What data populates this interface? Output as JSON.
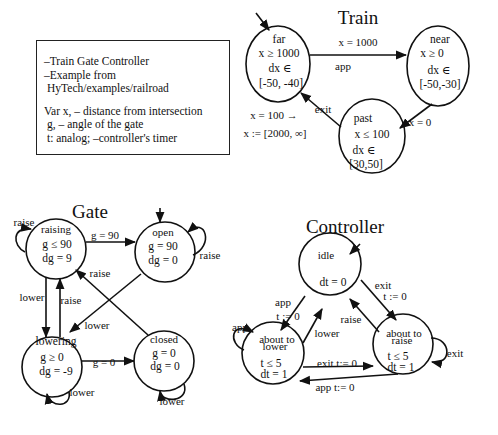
{
  "info_box": {
    "lines_top": [
      "–Train Gate Controller",
      "–Example from",
      " HyTech/examples/railroad"
    ],
    "lines_bottom": [
      "Var x, – distance from intersection",
      " g, – angle of the gate",
      " t: analog; –controller's timer"
    ]
  },
  "train": {
    "title": "Train",
    "states": {
      "far": {
        "name": "far",
        "invariant": "x ≥ 1000",
        "flow1": "dx ∈",
        "flow2": "[-50, -40]"
      },
      "near": {
        "name": "near",
        "invariant": "x ≥ 0",
        "flow1": "dx ∈",
        "flow2": "[-50,-30]"
      },
      "past": {
        "name": "past",
        "invariant": "x ≤ 100",
        "flow1": "dx ∈",
        "flow2": "[30,50]"
      }
    },
    "edges": {
      "far_near_guard": "x = 1000",
      "far_near_event": "app",
      "near_past_guard": "x = 0",
      "past_far_event": "exit",
      "past_far_guard": "x = 100 →",
      "past_far_reset": "x := [2000, ∞]"
    }
  },
  "gate": {
    "title": "Gate",
    "states": {
      "raising": {
        "name": "raising",
        "invariant": "g ≤ 90",
        "flow": "dg = 9"
      },
      "open": {
        "name": "open",
        "invariant": "g = 90",
        "flow": "dg = 0"
      },
      "lowering": {
        "name": "lowering",
        "invariant": "g ≥ 0",
        "flow": "dg = -9"
      },
      "closed": {
        "name": "closed",
        "invariant": "g = 0",
        "flow": "dg = 0"
      }
    },
    "edges": {
      "raising_self": "raise",
      "raising_open": "g = 90",
      "open_self": "raise",
      "closed_raising": "raise",
      "raising_lowering": "lower",
      "lowering_raising": "raise",
      "open_lowering": "lower",
      "lowering_closed": "g = 0",
      "lowering_self": "lower",
      "closed_self": "lower"
    }
  },
  "controller": {
    "title": "Controller",
    "states": {
      "idle": {
        "name": "idle",
        "flow": "dt = 0"
      },
      "about_to_lower": {
        "name1": "about to",
        "name2": "lower",
        "invariant": "t ≤ 5",
        "flow": "dt = 1"
      },
      "about_to_raise": {
        "name1": "about to",
        "name2": "raise",
        "invariant": "t ≤ 5",
        "flow": "dt = 1"
      }
    },
    "edges": {
      "idle_lower_event": "app",
      "idle_lower_reset": "t := 0",
      "lower_idle": "lower",
      "idle_raise_event": "exit",
      "idle_raise_reset": "t := 0",
      "raise_idle": "raise",
      "lower_self": "app",
      "raise_self": "exit",
      "lower_raise": "exit t:= 0",
      "raise_lower": "app t:= 0"
    }
  }
}
